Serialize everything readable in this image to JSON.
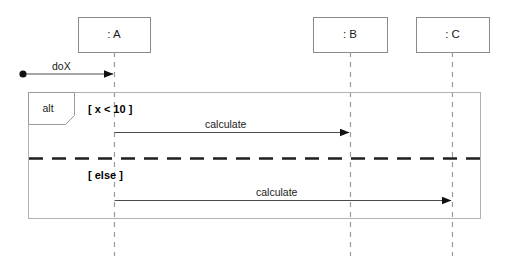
{
  "diagram": {
    "type": "uml-sequence-diagram",
    "colors": {
      "stroke": "#8a8a8a",
      "line": "#6e6e6e",
      "text": "#000000",
      "separator": "#1a1a1a",
      "background": "#ffffff"
    },
    "lifelines": [
      {
        "id": "A",
        "label": ": A",
        "x": 114,
        "box": {
          "x": 78,
          "y": 17,
          "w": 72,
          "h": 35
        },
        "bottom": 256
      },
      {
        "id": "B",
        "label": ": B",
        "x": 350,
        "box": {
          "x": 313,
          "y": 17,
          "w": 74,
          "h": 35
        },
        "bottom": 256
      },
      {
        "id": "C",
        "label": ": C",
        "x": 452,
        "box": {
          "x": 416,
          "y": 17,
          "w": 73,
          "h": 35
        },
        "bottom": 256
      }
    ],
    "found_message": {
      "label": "doX",
      "origin_x": 23,
      "target_x": 114,
      "y": 74,
      "dot_radius": 3.6
    },
    "fragment": {
      "operator": "alt",
      "x": 28,
      "y": 92,
      "w": 452,
      "h": 126,
      "tab": {
        "w": 46,
        "h": 32,
        "notch": 9
      },
      "separator_y": 158,
      "operands": [
        {
          "guard": "[ x < 10 ]",
          "guard_x": 88,
          "guard_y": 110,
          "message": {
            "label": "calculate",
            "from": "A",
            "to": "B",
            "from_x": 114,
            "to_x": 350,
            "y": 132,
            "label_x": 232,
            "label_y": 123
          }
        },
        {
          "guard": "[ else ]",
          "guard_x": 88,
          "guard_y": 175,
          "message": {
            "label": "calculate",
            "from": "A",
            "to": "C",
            "from_x": 114,
            "to_x": 452,
            "y": 200,
            "label_x": 283,
            "label_y": 191
          }
        }
      ]
    }
  }
}
